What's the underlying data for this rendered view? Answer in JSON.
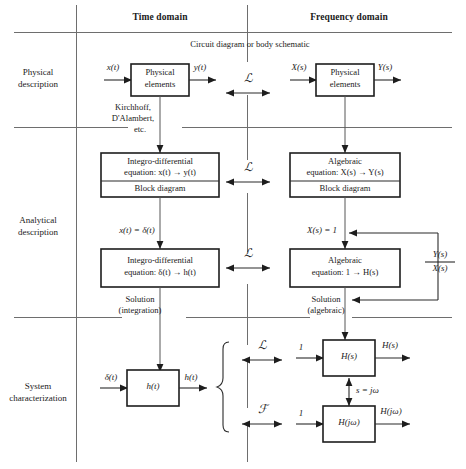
{
  "figure": {
    "headers": {
      "time_domain": "Time domain",
      "frequency_domain": "Frequency domain"
    },
    "top_caption": "Circuit diagram or body schematic",
    "row_labels": {
      "physical": "Physical\ndescription",
      "physical_l1": "Physical",
      "physical_l2": "description",
      "analytical_l1": "Analytical",
      "analytical_l2": "description",
      "system_l1": "System",
      "system_l2": "characterization"
    },
    "operators": {
      "laplace": "ℒ",
      "fourier": "ℱ"
    },
    "row1": {
      "left_input": "x(t)",
      "left_box_l1": "Physical",
      "left_box_l2": "elements",
      "left_output": "y(t)",
      "right_input": "X(s)",
      "right_box_l1": "Physical",
      "right_box_l2": "elements",
      "right_output": "Y(s)"
    },
    "laws": {
      "l1": "Kirchhoff,",
      "l2": "D'Alambert,",
      "l3": "etc."
    },
    "row2": {
      "left_box_l1": "Integro-differential",
      "left_box_l2": "equation: x(t) → y(t)",
      "left_box_l3": "Block diagram",
      "right_box_l1": "Algebraic",
      "right_box_l2": "equation: X(s) → Y(s)",
      "right_box_l3": "Block diagram"
    },
    "row3": {
      "left_condition": "x(t) = δ(t)",
      "right_condition": "X(s) = 1",
      "left_box_l1": "Integro-differential",
      "left_box_l2": "equation: δ(t) → h(t)",
      "right_box_l1": "Algebraic",
      "right_box_l2": "equation: 1 → H(s)",
      "transfer_num": "Y(s)",
      "transfer_den": "X(s)"
    },
    "solution": {
      "left_l1": "Solution",
      "left_l2": "(integration)",
      "right_l1": "Solution",
      "right_l2": "(algebraic)"
    },
    "row4": {
      "left_input": "δ(t)",
      "left_box": "h(t)",
      "left_output": "h(t)",
      "hs_input": "1",
      "hs_box": "H(s)",
      "hs_output": "H(s)",
      "relation": "s = jω",
      "hjw_input": "1",
      "hjw_box": "H(jω)",
      "hjw_output": "H(jω)"
    }
  },
  "colors": {
    "ink": "#1a1a1a",
    "rule": "#6e6e6e",
    "box_stroke": "#1d1d1d",
    "background": "#ffffff"
  }
}
